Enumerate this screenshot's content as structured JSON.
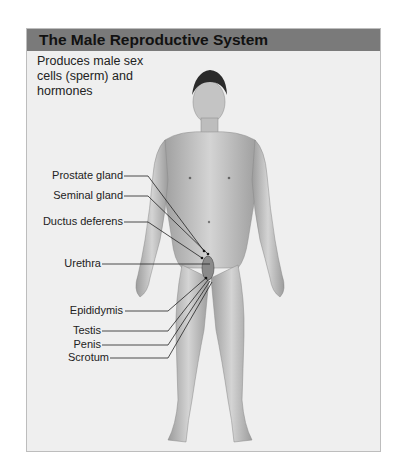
{
  "header": {
    "title": "The Male Reproductive System"
  },
  "description": "Produces male sex cells (sperm) and hormones",
  "labels": [
    {
      "text": "Prostate gland",
      "y": 176
    },
    {
      "text": "Seminal gland",
      "y": 196
    },
    {
      "text": "Ductus deferens",
      "y": 222
    },
    {
      "text": "Urethra",
      "y": 264
    },
    {
      "text": "Epididymis",
      "y": 311
    },
    {
      "text": "Testis",
      "y": 331
    },
    {
      "text": "Penis",
      "y": 345
    },
    {
      "text": "Scrotum",
      "y": 358
    }
  ],
  "colors": {
    "header_bg": "#7a7a7a",
    "panel_bg": "#efefef",
    "skin": "#c9c9c9"
  }
}
